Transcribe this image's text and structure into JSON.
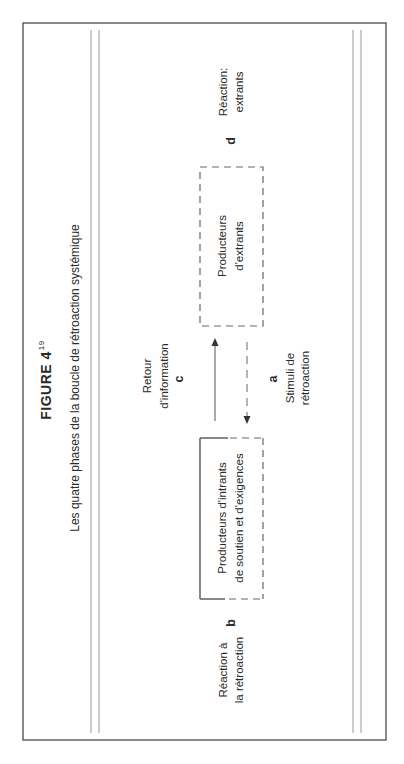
{
  "figure": {
    "title": "FIGURE 4",
    "title_superscript": "19",
    "subtitle": "Les quatre phases de la boucle de rétroaction systémique"
  },
  "nodes": {
    "output_producers": {
      "lines": [
        "Producteurs",
        "d'extrants"
      ],
      "border": "dashed"
    },
    "input_producers": {
      "lines": [
        "Producteurs d'intrants",
        "de soutien et d'exigences"
      ],
      "border": "partially-solid"
    }
  },
  "phases": {
    "a": {
      "letter": "a",
      "lines": [
        "Stimuli de",
        "rétroaction"
      ]
    },
    "b": {
      "letter": "b",
      "lines": [
        "Réaction à",
        "la rétroaction"
      ]
    },
    "c": {
      "letter": "c",
      "lines": [
        "Retour",
        "d'information"
      ]
    },
    "d": {
      "letter": "d",
      "lines": [
        "Réaction:",
        "extrants"
      ]
    }
  },
  "arrows": [
    {
      "from": "input_producers",
      "to": "output_producers",
      "style": "solid",
      "phase": "c"
    },
    {
      "from": "output_producers",
      "to": "input_producers",
      "style": "dashed",
      "phase": "a"
    }
  ],
  "colors": {
    "ink": "#2a2a2a",
    "frame": "#4a4a4a",
    "rule": "#9a9a9a",
    "dash": "#666666"
  }
}
